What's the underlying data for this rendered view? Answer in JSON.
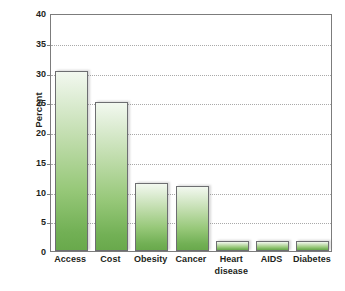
{
  "chart_data": {
    "type": "bar",
    "title": "",
    "subtitle": "",
    "xlabel": "",
    "ylabel": "Percent",
    "categories": [
      "Access",
      "Cost",
      "Obesity",
      "Cancer",
      "Heart disease",
      "AIDS",
      "Diabetes"
    ],
    "category_lines": [
      [
        "Access"
      ],
      [
        "Cost"
      ],
      [
        "Obesity"
      ],
      [
        "Cancer"
      ],
      [
        "Heart",
        "disease"
      ],
      [
        "AIDS"
      ],
      [
        "Diabetes"
      ]
    ],
    "values": [
      30.2,
      25.0,
      11.5,
      11.0,
      1.7,
      1.6,
      1.6
    ],
    "ylim": [
      0,
      40
    ],
    "yticks": [
      0,
      5,
      10,
      15,
      20,
      25,
      30,
      35,
      40
    ],
    "ytick_labels": [
      "0",
      "5",
      "10",
      "15",
      "20",
      "25",
      "30",
      "35",
      "40"
    ],
    "grid": true,
    "grid_axis": "y",
    "legend": false,
    "legend_position": "none",
    "series": [
      {
        "name": "Percent",
        "values": [
          30.2,
          25.0,
          11.5,
          11.0,
          1.7,
          1.6,
          1.6
        ]
      }
    ]
  },
  "style": {
    "bar_fill_top": "#f2f8ef",
    "bar_fill_bottom": "#69a94c",
    "bar_border": "#6d6e71",
    "frame_color": "#7c7c7c",
    "gridline_color": "#a9a9a9",
    "text_color": "#231f20",
    "background": "#ffffff"
  }
}
